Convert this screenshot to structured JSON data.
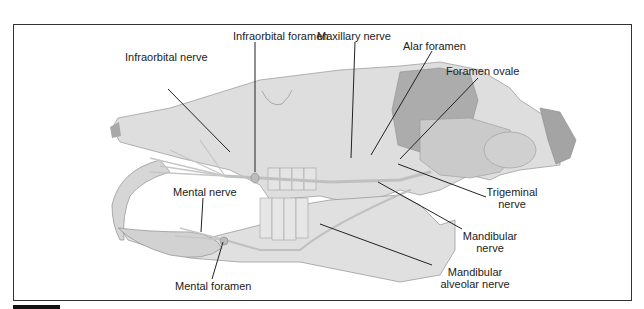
{
  "figure": {
    "labels": {
      "infraorbital_foramen": "Infraorbital foramen",
      "infraorbital_nerve": "Infraorbital nerve",
      "maxillary_nerve": "Maxillary nerve",
      "alar_foramen": "Alar foramen",
      "foramen_ovale": "Foramen ovale",
      "trigeminal_nerve_1": "Trigeminal",
      "trigeminal_nerve_2": "nerve",
      "mandibular_nerve_1": "Mandibular",
      "mandibular_nerve_2": "nerve",
      "mandibular_alveolar_nerve_1": "Mandibular",
      "mandibular_alveolar_nerve_2": "alveolar nerve",
      "mental_nerve": "Mental nerve",
      "mental_foramen": "Mental foramen"
    },
    "colors": {
      "bone": "#dcdcdc",
      "bone_dark": "#b8b8b8",
      "orbit": "#a9a9a9",
      "nerve": "#c4c4c4",
      "outline": "#9a9a9a",
      "leader": "#222222",
      "frame": "#333333"
    }
  }
}
